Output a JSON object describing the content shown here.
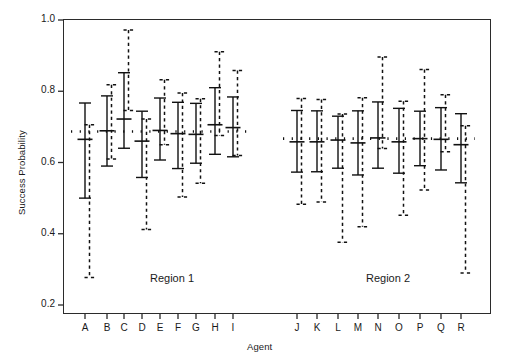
{
  "figure": {
    "background": "#ffffff",
    "axis_color": "#2b2b2b",
    "series_color": "#111111"
  },
  "chart_data": {
    "type": "scatter",
    "title": "",
    "xlabel": "Agent",
    "ylabel": "Success Probability",
    "ylim": [
      0.2,
      1.0
    ],
    "yticks": [
      0.2,
      0.4,
      0.6,
      0.8,
      1.0
    ],
    "ytick_labels": [
      "0.2",
      "0.4",
      "0.6",
      "0.8",
      "1.0"
    ],
    "grid": false,
    "legend": "none",
    "categories": [
      "A",
      "B",
      "C",
      "D",
      "E",
      "F",
      "G",
      "H",
      "I",
      "J",
      "K",
      "L",
      "M",
      "N",
      "O",
      "P",
      "Q",
      "R"
    ],
    "annotations": [
      {
        "text": "Region 1",
        "x_category": "D",
        "y": 0.27
      },
      {
        "text": "Region 2",
        "x_category": "M",
        "y": 0.27
      }
    ],
    "reference_lines": [
      {
        "label": "Region 1 pooled",
        "value": 0.687,
        "style": "dotted",
        "from_category": "A",
        "to_category": "I"
      },
      {
        "label": "Region 2 pooled",
        "value": 0.667,
        "style": "dotted",
        "from_category": "J",
        "to_category": "R"
      }
    ],
    "series": [
      {
        "name": "Estimate with 50% (solid) and 95% (dashed) intervals",
        "points": [
          {
            "category": "A",
            "region": "Region 1",
            "estimate": 0.665,
            "solid_low": 0.5,
            "solid_high": 0.767,
            "dashed_low": 0.277,
            "dashed_high": 0.706
          },
          {
            "category": "B",
            "region": "Region 1",
            "estimate": 0.689,
            "solid_low": 0.59,
            "solid_high": 0.787,
            "dashed_low": 0.61,
            "dashed_high": 0.818
          },
          {
            "category": "C",
            "region": "Region 1",
            "estimate": 0.722,
            "solid_low": 0.64,
            "solid_high": 0.852,
            "dashed_low": 0.746,
            "dashed_high": 0.972
          },
          {
            "category": "D",
            "region": "Region 1",
            "estimate": 0.66,
            "solid_low": 0.558,
            "solid_high": 0.744,
            "dashed_low": 0.412,
            "dashed_high": 0.722
          },
          {
            "category": "E",
            "region": "Region 1",
            "estimate": 0.69,
            "solid_low": 0.607,
            "solid_high": 0.781,
            "dashed_low": 0.65,
            "dashed_high": 0.832
          },
          {
            "category": "F",
            "region": "Region 1",
            "estimate": 0.681,
            "solid_low": 0.583,
            "solid_high": 0.769,
            "dashed_low": 0.503,
            "dashed_high": 0.795
          },
          {
            "category": "G",
            "region": "Region 1",
            "estimate": 0.679,
            "solid_low": 0.598,
            "solid_high": 0.766,
            "dashed_low": 0.542,
            "dashed_high": 0.779
          },
          {
            "category": "H",
            "region": "Region 1",
            "estimate": 0.706,
            "solid_low": 0.623,
            "solid_high": 0.81,
            "dashed_low": 0.676,
            "dashed_high": 0.911
          },
          {
            "category": "I",
            "region": "Region 1",
            "estimate": 0.698,
            "solid_low": 0.616,
            "solid_high": 0.784,
            "dashed_low": 0.62,
            "dashed_high": 0.858
          },
          {
            "category": "J",
            "region": "Region 2",
            "estimate": 0.658,
            "solid_low": 0.573,
            "solid_high": 0.746,
            "dashed_low": 0.483,
            "dashed_high": 0.78
          },
          {
            "category": "K",
            "region": "Region 2",
            "estimate": 0.658,
            "solid_low": 0.574,
            "solid_high": 0.745,
            "dashed_low": 0.489,
            "dashed_high": 0.777
          },
          {
            "category": "L",
            "region": "Region 2",
            "estimate": 0.663,
            "solid_low": 0.584,
            "solid_high": 0.73,
            "dashed_low": 0.376,
            "dashed_high": 0.736
          },
          {
            "category": "M",
            "region": "Region 2",
            "estimate": 0.655,
            "solid_low": 0.565,
            "solid_high": 0.745,
            "dashed_low": 0.42,
            "dashed_high": 0.782
          },
          {
            "category": "N",
            "region": "Region 2",
            "estimate": 0.669,
            "solid_low": 0.584,
            "solid_high": 0.77,
            "dashed_low": 0.639,
            "dashed_high": 0.896
          },
          {
            "category": "O",
            "region": "Region 2",
            "estimate": 0.658,
            "solid_low": 0.57,
            "solid_high": 0.752,
            "dashed_low": 0.452,
            "dashed_high": 0.772
          },
          {
            "category": "P",
            "region": "Region 2",
            "estimate": 0.667,
            "solid_low": 0.591,
            "solid_high": 0.744,
            "dashed_low": 0.523,
            "dashed_high": 0.861
          },
          {
            "category": "Q",
            "region": "Region 2",
            "estimate": 0.665,
            "solid_low": 0.579,
            "solid_high": 0.754,
            "dashed_low": 0.63,
            "dashed_high": 0.79
          },
          {
            "category": "R",
            "region": "Region 2",
            "estimate": 0.65,
            "solid_low": 0.543,
            "solid_high": 0.737,
            "dashed_low": 0.29,
            "dashed_high": 0.703
          }
        ]
      }
    ]
  }
}
